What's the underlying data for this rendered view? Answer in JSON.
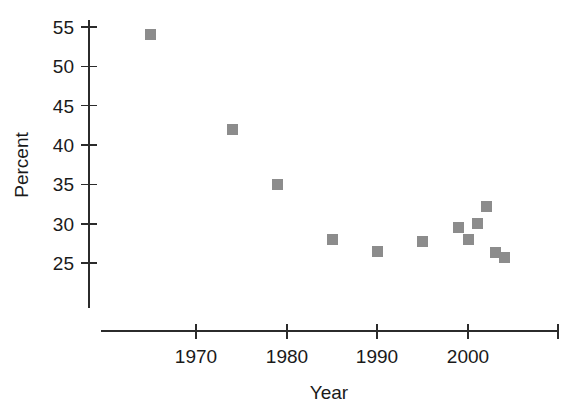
{
  "chart_data": {
    "type": "scatter",
    "title": "",
    "xlabel": "Year",
    "ylabel": "Percent",
    "xlim": [
      1962,
      2011
    ],
    "ylim": [
      22.5,
      56.5
    ],
    "grid": false,
    "legend": "none",
    "marker_color": "#8c8c8c",
    "marker_shape": "square",
    "axis_color": "#2b2b2b",
    "x_ticks": [
      1970,
      1980,
      1990,
      2000,
      2010
    ],
    "x_tick_labels": [
      "1970",
      "1980",
      "1990",
      "2000",
      ""
    ],
    "y_ticks": [
      25,
      30,
      35,
      40,
      45,
      50,
      55
    ],
    "y_tick_labels": [
      "25",
      "30",
      "35",
      "40",
      "45",
      "50",
      "55"
    ],
    "x": [
      1965,
      1974,
      1979,
      1985,
      1990,
      1995,
      1999,
      2000,
      2001,
      2002,
      2003,
      2004
    ],
    "values": [
      54.0,
      42.0,
      35.0,
      28.0,
      26.5,
      27.8,
      29.5,
      28.0,
      30.0,
      32.2,
      26.4,
      25.7
    ],
    "points": [
      {
        "x": 1965,
        "y": 54.0
      },
      {
        "x": 1974,
        "y": 42.0
      },
      {
        "x": 1979,
        "y": 35.0
      },
      {
        "x": 1985,
        "y": 28.0
      },
      {
        "x": 1990,
        "y": 26.5
      },
      {
        "x": 1995,
        "y": 27.8
      },
      {
        "x": 1999,
        "y": 29.5
      },
      {
        "x": 2000,
        "y": 28.0
      },
      {
        "x": 2001,
        "y": 30.0
      },
      {
        "x": 2002,
        "y": 32.2
      },
      {
        "x": 2003,
        "y": 26.4
      },
      {
        "x": 2004,
        "y": 25.7
      }
    ]
  }
}
